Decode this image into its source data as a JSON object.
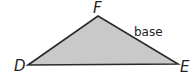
{
  "diagram": {
    "type": "triangle",
    "vertices": [
      "D",
      "E",
      "F"
    ],
    "side_label": "base",
    "labeled_side": "FE",
    "fill_color": "#c9c9c9",
    "stroke_color": "#2a2a2a"
  }
}
